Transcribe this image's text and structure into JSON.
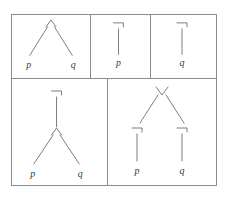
{
  "figure": {
    "background_color": "#ffffff",
    "border_color": "#8c8c8c",
    "stroke_color": "#6e6e6e",
    "label_color": "#3a3a3a"
  },
  "cells": [
    {
      "id": "conjunction",
      "root_operator": "∧",
      "root_operator_name": "and",
      "expression": "p ∧ q",
      "leaves": [
        {
          "label": "p"
        },
        {
          "label": "q"
        }
      ]
    },
    {
      "id": "negation-p",
      "root_operator": "¬",
      "root_operator_name": "not",
      "expression": "¬ p",
      "leaves": [
        {
          "label": "p"
        }
      ]
    },
    {
      "id": "negation-q",
      "root_operator": "¬",
      "root_operator_name": "not",
      "expression": "¬ q",
      "leaves": [
        {
          "label": "q"
        }
      ]
    },
    {
      "id": "negated-conjunction",
      "root_operator": "¬",
      "root_operator_name": "not",
      "child_operator": "∧",
      "child_operator_name": "and",
      "expression": "¬ (p ∧ q)",
      "leaves": [
        {
          "label": "p"
        },
        {
          "label": "q"
        }
      ]
    },
    {
      "id": "disjunction-of-negations",
      "root_operator": "∨",
      "root_operator_name": "or",
      "child_operator": "¬",
      "child_operator_name": "not",
      "expression": "¬ p ∨ ¬ q",
      "leaves": [
        {
          "label": "p"
        },
        {
          "label": "q"
        }
      ]
    }
  ]
}
